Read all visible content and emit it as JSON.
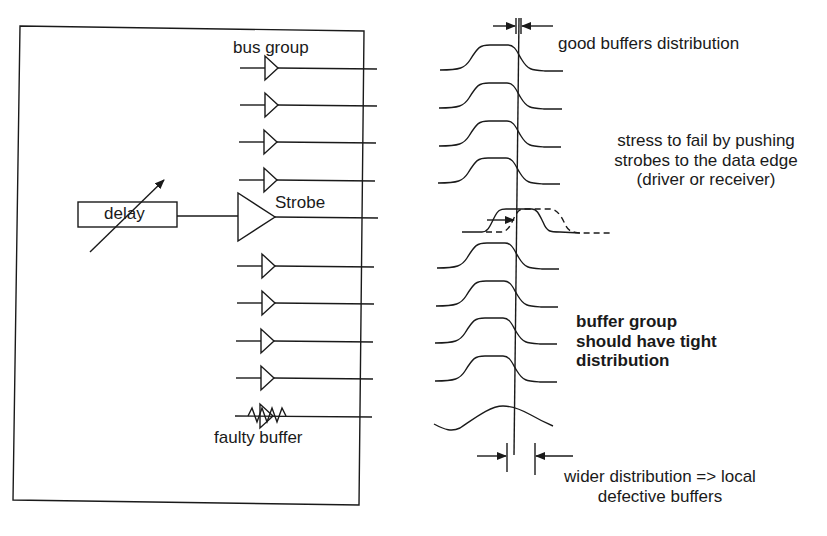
{
  "diagram": {
    "colors": {
      "ink": "#1a1a1a",
      "background": "#ffffff"
    },
    "left_panel": {
      "bus_group_label": "bus group",
      "strobe_label": "Strobe",
      "delay_label": "delay",
      "faulty_label": "faulty buffer",
      "buffer_rows_y": [
        68,
        105,
        142,
        180,
        266,
        303,
        341,
        378
      ],
      "strobe_row_y": 217,
      "faulty_row_y": 416
    },
    "right_panel": {
      "good_label": "good buffers distribution",
      "stress_label_lines": [
        "stress to fail by pushing",
        "strobes to the data edge",
        "(driver or receiver)"
      ],
      "tight_label_lines": [
        "buffer group",
        "should have tight",
        "distribution"
      ],
      "wider_label_lines": [
        "wider distribution => local",
        "defective buffers"
      ],
      "waveform_rows_y": [
        70,
        108,
        146,
        183,
        268,
        306,
        343,
        381
      ]
    }
  }
}
